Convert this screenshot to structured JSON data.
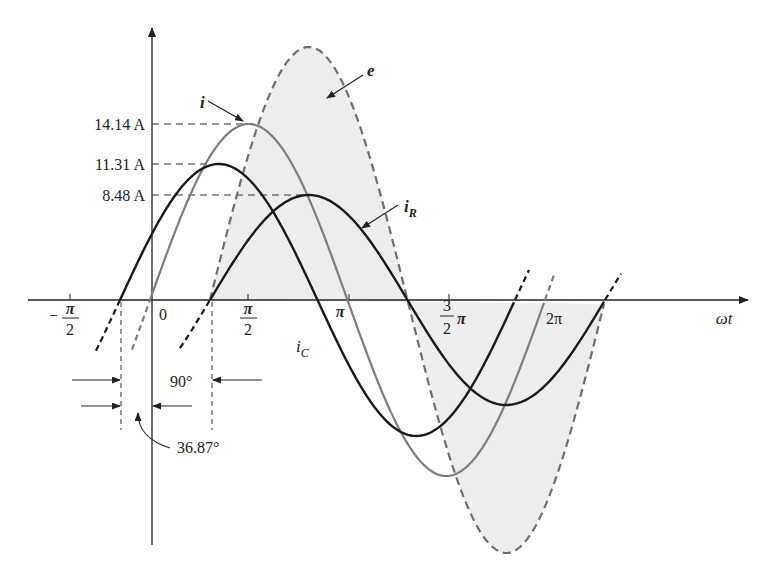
{
  "figure": {
    "caption": "FIG. 15.xx",
    "axes": {
      "x_label": "ωt",
      "x_ticks": [
        {
          "label_num": "π",
          "label_den": "2",
          "sign": "−",
          "pos": "-pi/2"
        },
        {
          "label": "0",
          "pos": "0"
        },
        {
          "label_num": "π",
          "label_den": "2",
          "sign": "",
          "pos": "pi/2"
        },
        {
          "label": "π",
          "pos": "pi"
        },
        {
          "label_num": "3",
          "label_den": "2",
          "suffix": "π",
          "pos": "3pi/2"
        },
        {
          "label": "2π",
          "pos": "2pi"
        }
      ]
    },
    "amplitude_labels": [
      {
        "text": "14.14 A",
        "curve": "i"
      },
      {
        "text": "11.31 A",
        "curve": "i_C"
      },
      {
        "text": "8.48 A",
        "curve": "i_R"
      }
    ],
    "curve_labels": {
      "e": "e",
      "i": "i",
      "i_R_base": "i",
      "i_R_sub": "R",
      "i_C_base": "i",
      "i_C_sub": "C"
    },
    "phase_annotations": {
      "lead_iC": "90°",
      "lead_i": "36.87°"
    },
    "colors": {
      "black_curve": "#1a1a1a",
      "gray_curve": "#7a7a7a",
      "dashed_e": "#6e6e6e",
      "fill_e": "#ececec",
      "axis": "#222222"
    }
  },
  "chart_data": {
    "type": "line",
    "title": "",
    "xlabel": "ωt",
    "ylabel": "",
    "x_ticks": [
      "−π/2",
      "0",
      "π/2",
      "π",
      "3π/2",
      "2π"
    ],
    "series": [
      {
        "name": "e",
        "style": "dashed, shaded",
        "amplitude": "largest (voltage)",
        "phase_deg": 0
      },
      {
        "name": "i",
        "style": "gray solid",
        "amplitude": 14.14,
        "unit": "A",
        "phase_deg": 36.87
      },
      {
        "name": "i_R",
        "style": "black solid",
        "amplitude": 8.48,
        "unit": "A",
        "phase_deg": 0
      },
      {
        "name": "i_C",
        "style": "black solid",
        "amplitude": 11.31,
        "unit": "A",
        "phase_deg": 90
      }
    ],
    "annotations": [
      "i_C leads e by 90°",
      "i leads e by 36.87°"
    ],
    "grid": false,
    "legend": "none (direct labels)"
  }
}
